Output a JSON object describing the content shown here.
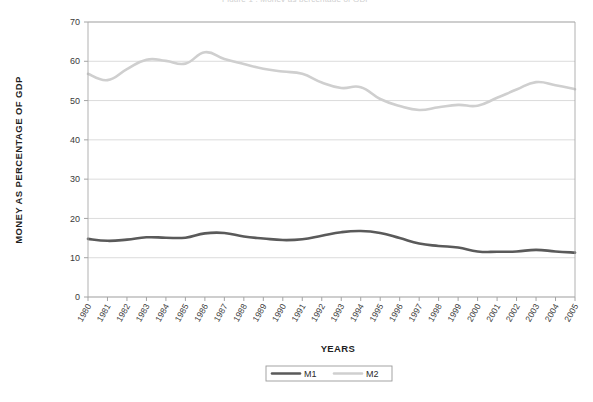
{
  "chart_data": {
    "type": "line",
    "title": "",
    "xlabel": "YEARS",
    "ylabel": "MONEY AS PERCENTAGE OF GDP",
    "ylim": [
      0,
      70
    ],
    "ytick_step": 10,
    "yticks": [
      0,
      10,
      20,
      30,
      40,
      50,
      60,
      70
    ],
    "grid": true,
    "legend_position": "bottom-center",
    "categories": [
      "1980",
      "1981",
      "1982",
      "1983",
      "1984",
      "1985",
      "1986",
      "1987",
      "1988",
      "1989",
      "1990",
      "1991",
      "1992",
      "1993",
      "1994",
      "1995",
      "1996",
      "1997",
      "1998",
      "1999",
      "2000",
      "2001",
      "2002",
      "2003",
      "2004",
      "2005"
    ],
    "series": [
      {
        "name": "M1",
        "color": "#5a5a5a",
        "width": 2.6,
        "values": [
          14.8,
          14.3,
          14.6,
          15.2,
          15.1,
          15.1,
          16.2,
          16.3,
          15.4,
          14.9,
          14.5,
          14.7,
          15.6,
          16.5,
          16.8,
          16.3,
          15.0,
          13.6,
          13.0,
          12.6,
          11.6,
          11.5,
          11.6,
          12.0,
          11.6,
          11.3
        ]
      },
      {
        "name": "M2",
        "color": "#cfcfcf",
        "width": 2.6,
        "values": [
          56.8,
          55.2,
          58.0,
          60.4,
          60.1,
          59.4,
          62.3,
          60.6,
          59.3,
          58.1,
          57.4,
          56.8,
          54.6,
          53.2,
          53.4,
          50.4,
          48.6,
          47.6,
          48.3,
          48.9,
          48.7,
          50.7,
          52.8,
          54.7,
          53.9,
          52.9
        ]
      }
    ]
  },
  "legend": {
    "items": [
      {
        "label": "M1",
        "color": "#5a5a5a"
      },
      {
        "label": "M2",
        "color": "#cfcfcf"
      }
    ]
  },
  "axes": {
    "y_title": "MONEY AS PERCENTAGE OF GDP",
    "x_title": "YEARS"
  },
  "clipped_header": "Figure 1 : Money as percentage of GDP"
}
